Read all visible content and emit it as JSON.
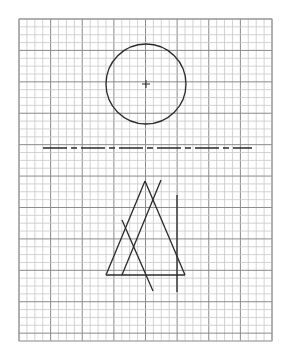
{
  "diagram": {
    "type": "technical-drawing-on-grid-paper",
    "grid": {
      "x": 19,
      "y": 19,
      "width": 253,
      "height": 322,
      "cell": 7.9,
      "major_every": 4,
      "minor_color": "#c8c8c8",
      "major_color": "#8a8a8a",
      "border_color": "#9a9a9a"
    },
    "ink_color": "#2a2a2a",
    "circle": {
      "cx": 146,
      "cy": 84,
      "r": 40,
      "center_mark_size": 4
    },
    "center_line": {
      "x1": 43,
      "y1": 148,
      "x2": 252,
      "y2": 148,
      "dash": "24 4 6 4"
    },
    "lines": [
      {
        "name": "triangle-left-side",
        "x1": 145,
        "y1": 181,
        "x2": 106,
        "y2": 275
      },
      {
        "name": "triangle-right-side",
        "x1": 145,
        "y1": 181,
        "x2": 185,
        "y2": 275
      },
      {
        "name": "triangle-base",
        "x1": 106,
        "y1": 275,
        "x2": 185,
        "y2": 275
      },
      {
        "name": "inner-parallel-line",
        "x1": 161,
        "y1": 180,
        "x2": 122,
        "y2": 275
      },
      {
        "name": "crossing-diagonal-line",
        "x1": 122,
        "y1": 220,
        "x2": 153,
        "y2": 291
      },
      {
        "name": "vertical-line",
        "x1": 177,
        "y1": 195,
        "x2": 177,
        "y2": 292
      }
    ]
  }
}
